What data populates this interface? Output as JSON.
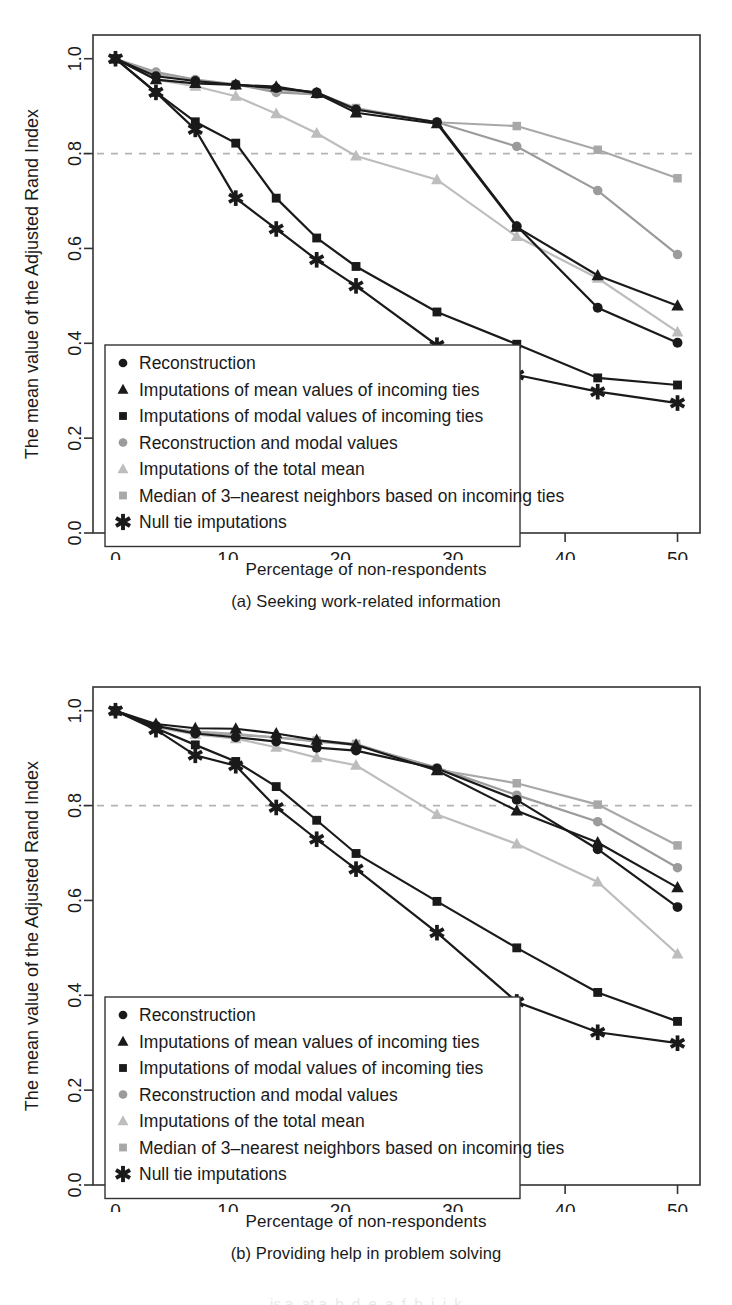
{
  "figure": {
    "bottom_partial_text": "is a, at a, b, d, e, a, f, h, i, j, k"
  },
  "panels": [
    {
      "id": "a",
      "caption": "(a) Seeking work-related information",
      "xlabel": "Percentage of non-respondents",
      "ylabel": "The mean value of the Adjusted Rand Index"
    },
    {
      "id": "b",
      "caption": "(b) Providing help in problem solving",
      "xlabel": "Percentage of non-respondents",
      "ylabel": "The mean value of the Adjusted Rand Index"
    }
  ],
  "chart_data": [
    {
      "type": "line",
      "title": "(a) Seeking work-related information",
      "xlabel": "Percentage of non-respondents",
      "ylabel": "The mean value of the Adjusted Rand Index",
      "xlim": [
        -2,
        52
      ],
      "ylim": [
        0.0,
        1.05
      ],
      "xticks": [
        0,
        10,
        20,
        30,
        40,
        50
      ],
      "xticklabels": [
        "0",
        "10",
        "20",
        "30",
        "40",
        "50"
      ],
      "yticks": [
        0.0,
        0.2,
        0.4,
        0.6,
        0.8,
        1.0
      ],
      "yticklabels": [
        "0.0",
        "0.2",
        "0.4",
        "0.6",
        "0.8",
        "1.0"
      ],
      "grid": false,
      "reference_line": {
        "y": 0.8,
        "style": "dashed",
        "color": "#b3b3b3"
      },
      "legend_position": "bottom-left",
      "x": [
        0,
        3.6,
        7.1,
        10.7,
        14.3,
        17.9,
        21.4,
        28.6,
        35.7,
        42.9,
        50
      ],
      "series": [
        {
          "name": "Reconstruction",
          "marker": "circle",
          "color": "#1a1a1a",
          "values": [
            1.0,
            0.963,
            0.953,
            0.945,
            0.938,
            0.929,
            0.893,
            0.866,
            0.647,
            0.475,
            0.401
          ]
        },
        {
          "name": "Imputations of mean values of incoming ties",
          "marker": "triangle",
          "color": "#1a1a1a",
          "values": [
            1.0,
            0.956,
            0.948,
            0.945,
            0.941,
            0.927,
            0.886,
            0.863,
            0.645,
            0.543,
            0.479
          ]
        },
        {
          "name": "Imputations of modal values of incoming ties",
          "marker": "square",
          "color": "#1a1a1a",
          "values": [
            1.0,
            0.929,
            0.867,
            0.822,
            0.706,
            0.622,
            0.562,
            0.466,
            0.398,
            0.327,
            0.312
          ]
        },
        {
          "name": "Reconstruction and modal values",
          "marker": "circle",
          "color": "#9b9b9b",
          "values": [
            1.0,
            0.972,
            0.956,
            0.946,
            0.929,
            0.925,
            0.893,
            0.866,
            0.815,
            0.722,
            0.587,
            0.521
          ]
        },
        {
          "name": "Imputations of the total mean",
          "marker": "triangle",
          "color": "#bdbdbd",
          "values": [
            1.0,
            0.956,
            0.942,
            0.921,
            0.884,
            0.843,
            0.795,
            0.745,
            0.625,
            0.537,
            0.424,
            0.369
          ]
        },
        {
          "name": "Median of 3-nearest neighbors based on incoming ties",
          "marker": "square",
          "color": "#a8a8a8",
          "values": [
            1.0,
            0.968,
            0.953,
            0.946,
            0.934,
            0.928,
            0.896,
            0.866,
            0.858,
            0.808,
            0.748,
            0.703
          ]
        },
        {
          "name": "Null tie imputations",
          "marker": "asterisk",
          "color": "#1a1a1a",
          "values": [
            1.0,
            0.929,
            0.851,
            0.706,
            0.641,
            0.576,
            0.521,
            0.396,
            0.333,
            0.298,
            0.274
          ]
        }
      ]
    },
    {
      "type": "line",
      "title": "(b) Providing help in problem solving",
      "xlabel": "Percentage of non-respondents",
      "ylabel": "The mean value of the Adjusted Rand Index",
      "xlim": [
        -2,
        52
      ],
      "ylim": [
        0.0,
        1.05
      ],
      "xticks": [
        0,
        10,
        20,
        30,
        40,
        50
      ],
      "xticklabels": [
        "0",
        "10",
        "20",
        "30",
        "40",
        "50"
      ],
      "yticks": [
        0.0,
        0.2,
        0.4,
        0.6,
        0.8,
        1.0
      ],
      "yticklabels": [
        "0.0",
        "0.2",
        "0.4",
        "0.6",
        "0.8",
        "1.0"
      ],
      "grid": false,
      "reference_line": {
        "y": 0.8,
        "style": "dashed",
        "color": "#b3b3b3"
      },
      "legend_position": "bottom-left",
      "x": [
        0,
        3.6,
        7.1,
        10.7,
        14.3,
        17.9,
        21.4,
        28.6,
        35.7,
        42.9,
        50
      ],
      "series": [
        {
          "name": "Reconstruction",
          "marker": "circle",
          "color": "#1a1a1a",
          "values": [
            1.0,
            0.968,
            0.952,
            0.944,
            0.935,
            0.922,
            0.916,
            0.878,
            0.812,
            0.708,
            0.586
          ]
        },
        {
          "name": "Imputations of mean values of incoming ties",
          "marker": "triangle",
          "color": "#1a1a1a",
          "values": [
            1.0,
            0.972,
            0.963,
            0.962,
            0.952,
            0.938,
            0.928,
            0.874,
            0.789,
            0.722,
            0.627
          ]
        },
        {
          "name": "Imputations of modal values of incoming ties",
          "marker": "square",
          "color": "#1a1a1a",
          "values": [
            1.0,
            0.963,
            0.928,
            0.893,
            0.84,
            0.769,
            0.699,
            0.598,
            0.5,
            0.406,
            0.345
          ]
        },
        {
          "name": "Reconstruction and modal values",
          "marker": "circle",
          "color": "#9b9b9b",
          "values": [
            1.0,
            0.966,
            0.955,
            0.949,
            0.944,
            0.935,
            0.928,
            0.88,
            0.822,
            0.766,
            0.669
          ]
        },
        {
          "name": "Imputations of the total mean",
          "marker": "triangle",
          "color": "#bdbdbd",
          "values": [
            1.0,
            0.965,
            0.95,
            0.941,
            0.923,
            0.901,
            0.885,
            0.781,
            0.719,
            0.639,
            0.487
          ]
        },
        {
          "name": "Median of 3-nearest neighbors based on incoming ties",
          "marker": "square",
          "color": "#a8a8a8",
          "values": [
            1.0,
            0.967,
            0.956,
            0.951,
            0.943,
            0.937,
            0.93,
            0.876,
            0.847,
            0.802,
            0.716
          ]
        },
        {
          "name": "Null tie imputations",
          "marker": "asterisk",
          "color": "#1a1a1a",
          "values": [
            1.0,
            0.96,
            0.906,
            0.884,
            0.796,
            0.729,
            0.666,
            0.532,
            0.386,
            0.322,
            0.299
          ]
        }
      ]
    }
  ]
}
